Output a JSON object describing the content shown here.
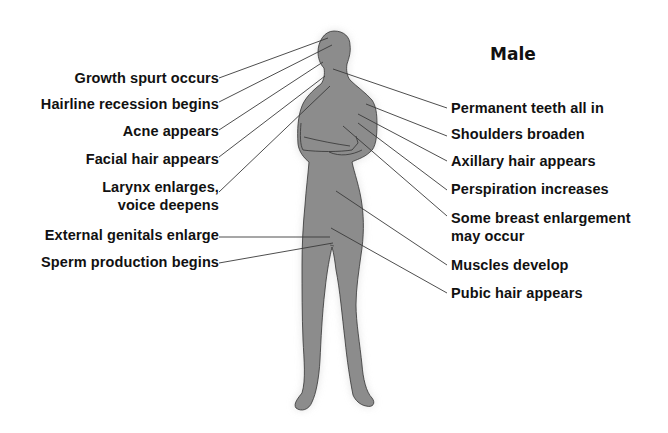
{
  "title": "Male",
  "colors": {
    "figure_fill": "#8c8c8c",
    "figure_glow": "#e6e6e6",
    "outline": "#333333",
    "leader_line": "#333333",
    "text": "#111111",
    "background": "#ffffff"
  },
  "labels_left": [
    {
      "text": "Growth spurt occurs",
      "x": 219,
      "y": 80
    },
    {
      "text": "Hairline recession begins",
      "x": 219,
      "y": 106
    },
    {
      "text": "Acne appears",
      "x": 219,
      "y": 133
    },
    {
      "text": "Facial hair appears",
      "x": 219,
      "y": 161
    },
    {
      "text": "Larynx enlarges,",
      "x": 219,
      "y": 189
    },
    {
      "text": "voice deepens",
      "x": 219,
      "y": 207
    },
    {
      "text": "External genitals enlarge",
      "x": 219,
      "y": 237
    },
    {
      "text": "Sperm production begins",
      "x": 219,
      "y": 264
    }
  ],
  "labels_right": [
    {
      "text": "Permanent teeth all in",
      "x": 451,
      "y": 110
    },
    {
      "text": "Shoulders broaden",
      "x": 451,
      "y": 136
    },
    {
      "text": "Axillary hair appears",
      "x": 451,
      "y": 163
    },
    {
      "text": "Perspiration increases",
      "x": 451,
      "y": 191
    },
    {
      "text": "Some breast enlargement",
      "x": 451,
      "y": 220
    },
    {
      "text": "may occur",
      "x": 451,
      "y": 238
    },
    {
      "text": "Muscles develop",
      "x": 451,
      "y": 267
    },
    {
      "text": "Pubic hair appears",
      "x": 451,
      "y": 295
    }
  ],
  "leader_lines": [
    {
      "name": "growth-spurt",
      "x1": 219,
      "y1": 78,
      "x2": 328,
      "y2": 38
    },
    {
      "name": "hairline-recession",
      "x1": 219,
      "y1": 102,
      "x2": 332,
      "y2": 45
    },
    {
      "name": "acne",
      "x1": 219,
      "y1": 130,
      "x2": 323,
      "y2": 62
    },
    {
      "name": "facial-hair",
      "x1": 219,
      "y1": 157,
      "x2": 325,
      "y2": 76
    },
    {
      "name": "larynx",
      "x1": 219,
      "y1": 192,
      "x2": 330,
      "y2": 86
    },
    {
      "name": "external-genitals",
      "x1": 219,
      "y1": 237,
      "x2": 330,
      "y2": 237
    },
    {
      "name": "sperm-production",
      "x1": 219,
      "y1": 263,
      "x2": 333,
      "y2": 243
    },
    {
      "name": "permanent-teeth",
      "x1": 447,
      "y1": 108,
      "x2": 333,
      "y2": 69
    },
    {
      "name": "shoulders",
      "x1": 447,
      "y1": 136,
      "x2": 366,
      "y2": 104
    },
    {
      "name": "axillary-hair",
      "x1": 447,
      "y1": 161,
      "x2": 358,
      "y2": 114
    },
    {
      "name": "perspiration",
      "x1": 447,
      "y1": 190,
      "x2": 358,
      "y2": 123
    },
    {
      "name": "breast-enlargement",
      "x1": 447,
      "y1": 216,
      "x2": 343,
      "y2": 126
    },
    {
      "name": "muscles",
      "x1": 447,
      "y1": 265,
      "x2": 336,
      "y2": 191
    },
    {
      "name": "pubic-hair",
      "x1": 447,
      "y1": 293,
      "x2": 331,
      "y2": 228
    }
  ]
}
